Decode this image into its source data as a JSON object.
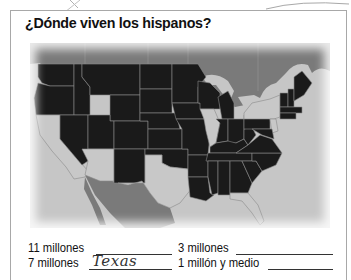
{
  "worksheet": {
    "title": "¿Dónde viven los hispanos?",
    "map": {
      "description": "Map of the continental United States; most states shaded black, states with large Hispanic populations left unshaded",
      "highlighted_states": [
        "California",
        "Arizona",
        "Texas",
        "Illinois",
        "Florida",
        "New York",
        "New Jersey"
      ],
      "colors": {
        "shaded_state": "#1a1a1a",
        "unshaded_state": "#c8c8c8",
        "neighbor_country": "#7a7a7a",
        "water": "#c4c4c4",
        "border": "#8a8a8a"
      }
    },
    "answers": [
      {
        "label": "11 millones",
        "value": ""
      },
      {
        "label": "3 millones",
        "value": ""
      },
      {
        "label": "7 millones",
        "value": "Texas"
      },
      {
        "label": "1 millón y medio",
        "value": ""
      }
    ]
  }
}
